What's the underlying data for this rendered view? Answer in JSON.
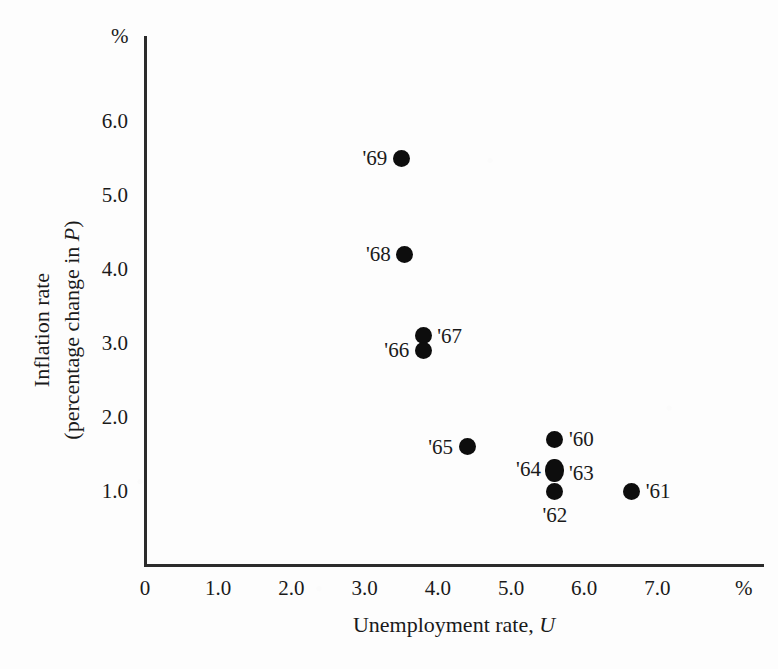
{
  "chart_data": {
    "type": "scatter",
    "title": "",
    "xlabel": "Unemployment rate, U",
    "ylabel": "Inflation rate (percentage change in P)",
    "ylabel_line1": "Inflation rate",
    "ylabel_line2_prefix": "(percentage change in ",
    "ylabel_line2_symbol": "P",
    "ylabel_line2_suffix": ")",
    "xlabel_prefix": "Unemployment rate, ",
    "xlabel_symbol": "U",
    "x_unit": "%",
    "y_unit": "%",
    "xlim": [
      0,
      7.6
    ],
    "ylim": [
      0,
      6.6
    ],
    "grid": false,
    "legend": "none",
    "xticks": [
      "0",
      "1.0",
      "2.0",
      "3.0",
      "4.0",
      "5.0",
      "6.0",
      "7.0"
    ],
    "xtick_values": [
      0,
      1,
      2,
      3,
      4,
      5,
      6,
      7
    ],
    "yticks": [
      "1.0",
      "2.0",
      "3.0",
      "4.0",
      "5.0",
      "6.0"
    ],
    "ytick_values": [
      1,
      2,
      3,
      4,
      5,
      6
    ],
    "points": [
      {
        "label": "'69",
        "x": 3.5,
        "y": 5.5,
        "label_pos": "left"
      },
      {
        "label": "'68",
        "x": 3.55,
        "y": 4.2,
        "label_pos": "left"
      },
      {
        "label": "'67",
        "x": 3.8,
        "y": 3.1,
        "label_pos": "right"
      },
      {
        "label": "'66",
        "x": 3.8,
        "y": 2.9,
        "label_pos": "left"
      },
      {
        "label": "'65",
        "x": 4.4,
        "y": 1.6,
        "label_pos": "left"
      },
      {
        "label": "'60",
        "x": 5.6,
        "y": 1.7,
        "label_pos": "right"
      },
      {
        "label": "'64",
        "x": 5.6,
        "y": 1.3,
        "label_pos": "left"
      },
      {
        "label": "'63",
        "x": 5.6,
        "y": 1.25,
        "label_pos": "right"
      },
      {
        "label": "'62",
        "x": 5.6,
        "y": 1.0,
        "label_pos": "below"
      },
      {
        "label": "'61",
        "x": 6.65,
        "y": 1.0,
        "label_pos": "right"
      }
    ]
  }
}
